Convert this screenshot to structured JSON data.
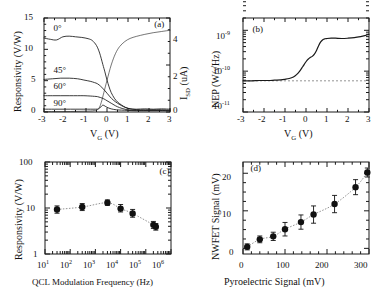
{
  "figure": {
    "width": 391,
    "height": 297,
    "background": "#ffffff",
    "line_color": "#1a1a1a",
    "marker_color": "#111111",
    "dash_color": "#777777"
  },
  "chart_data": [
    {
      "id": "a",
      "panel_label": "(a)",
      "type": "line",
      "title": "",
      "xlabel": "V_G (V)",
      "xlabel_parts": {
        "base": "V",
        "sub": "G",
        "unit": " (V)"
      },
      "ylabel": "Responsivity (V/W)",
      "ylabel_right": "I_SD (uA)",
      "ylabel_right_parts": {
        "base": "I",
        "sub": "SD",
        "unit": " (uA)"
      },
      "xlim": [
        -3,
        3
      ],
      "ylim": [
        0,
        15
      ],
      "ylim_right": [
        0,
        4.6
      ],
      "xticks": [
        -3,
        -2,
        -1,
        0,
        1,
        2,
        3
      ],
      "yticks": [
        0,
        5,
        10,
        15
      ],
      "yticks_right": [
        0,
        2,
        4
      ],
      "grid": false,
      "legend_position": "inline-annotations",
      "annotations": [
        "0°",
        "45°",
        "60°",
        "90°"
      ],
      "series": [
        {
          "name": "0°",
          "axis": "left",
          "x": [
            -3,
            -2.7,
            -2.4,
            -2.1,
            -1.8,
            -1.5,
            -1.2,
            -0.9,
            -0.7,
            -0.5,
            -0.35,
            -0.2,
            -0.1,
            0,
            0.1,
            0.2,
            0.35,
            0.5,
            0.7,
            0.9,
            1.1,
            1.4,
            1.8,
            2.2,
            2.6,
            3
          ],
          "values": [
            11.8,
            11.6,
            11.5,
            12.0,
            12.1,
            12.0,
            11.9,
            11.7,
            11.4,
            10.6,
            9.4,
            7.6,
            6.4,
            5.1,
            4.0,
            3.1,
            2.2,
            1.6,
            1.1,
            0.7,
            0.5,
            0.45,
            0.5,
            0.45,
            0.5,
            0.45
          ]
        },
        {
          "name": "45°",
          "axis": "left",
          "x": [
            -3,
            -2.6,
            -2.2,
            -1.8,
            -1.4,
            -1.1,
            -0.8,
            -0.6,
            -0.45,
            -0.3,
            -0.15,
            0,
            0.15,
            0.3,
            0.5,
            0.7,
            0.9,
            1.2,
            1.6,
            2.1,
            2.6,
            3
          ],
          "values": [
            5.2,
            5.3,
            5.4,
            5.4,
            5.3,
            5.1,
            4.9,
            4.7,
            4.5,
            4.1,
            3.6,
            3.0,
            2.4,
            1.9,
            1.4,
            1.0,
            0.7,
            0.45,
            0.35,
            0.35,
            0.35,
            0.3
          ]
        },
        {
          "name": "60°",
          "axis": "left",
          "x": [
            -3,
            -2.6,
            -2.2,
            -1.8,
            -1.4,
            -1.1,
            -0.8,
            -0.6,
            -0.45,
            -0.3,
            -0.15,
            0,
            0.2,
            0.4,
            0.6,
            0.85,
            1.1,
            1.5,
            2.0,
            2.5,
            3
          ],
          "values": [
            2.6,
            2.6,
            2.6,
            2.6,
            2.6,
            2.6,
            2.55,
            2.5,
            2.45,
            2.3,
            2.1,
            1.8,
            1.4,
            1.0,
            0.7,
            0.45,
            0.3,
            0.25,
            0.25,
            0.25,
            0.2
          ]
        },
        {
          "name": "90°",
          "axis": "left",
          "x": [
            -3,
            -2.5,
            -2.0,
            -1.5,
            -1.1,
            -0.8,
            -0.55,
            -0.4,
            -0.3,
            -0.2,
            -0.1,
            0,
            0.2,
            0.45,
            0.7,
            1.0,
            1.4,
            1.9,
            2.4,
            3
          ],
          "values": [
            0.45,
            0.45,
            0.45,
            0.45,
            0.45,
            0.45,
            0.45,
            0.5,
            0.8,
            1.1,
            0.95,
            0.75,
            0.5,
            0.35,
            0.3,
            0.25,
            0.2,
            0.2,
            0.2,
            0.2
          ]
        },
        {
          "name": "I_SD",
          "axis": "right",
          "x": [
            -3,
            -2.5,
            -2.0,
            -1.5,
            -1.1,
            -0.8,
            -0.6,
            -0.45,
            -0.35,
            -0.25,
            -0.15,
            0,
            0.2,
            0.4,
            0.6,
            0.85,
            1.1,
            1.4,
            1.8,
            2.2,
            2.6,
            3
          ],
          "values": [
            0.02,
            0.02,
            0.02,
            0.03,
            0.04,
            0.05,
            0.07,
            0.12,
            0.25,
            0.55,
            0.95,
            1.55,
            2.3,
            2.85,
            3.2,
            3.45,
            3.6,
            3.7,
            3.8,
            3.88,
            3.94,
            4.0
          ]
        }
      ]
    },
    {
      "id": "b",
      "panel_label": "(b)",
      "type": "line",
      "title": "",
      "xlabel": "V_G (V)",
      "xlabel_parts": {
        "base": "V",
        "sub": "G",
        "unit": " (V)"
      },
      "ylabel": "NEP (W/√Hz)",
      "xlim": [
        -3,
        3
      ],
      "ylim": [
        1e-11,
        2e-09
      ],
      "yscale": "log",
      "xticks": [
        -3,
        -2,
        -1,
        0,
        1,
        2,
        3
      ],
      "yticks": [
        1e-11,
        1e-10,
        1e-09
      ],
      "ytick_labels": [
        "10⁻¹¹",
        "10⁻¹⁰",
        "10⁻⁹"
      ],
      "grid": false,
      "reference_line": {
        "type": "horizontal-dashed",
        "value": 5.8e-11
      },
      "series": [
        {
          "name": "NEP",
          "x": [
            -3,
            -2.6,
            -2.2,
            -1.8,
            -1.5,
            -1.2,
            -1.0,
            -0.8,
            -0.6,
            -0.45,
            -0.3,
            -0.15,
            0,
            0.1,
            0.2,
            0.3,
            0.4,
            0.5,
            0.6,
            0.7,
            0.8,
            0.9,
            1.0,
            1.2,
            1.4,
            1.7,
            2.0,
            2.3,
            2.6,
            2.8,
            3.0
          ],
          "values": [
            5.8e-11,
            5.8e-11,
            5.9e-11,
            5.9e-11,
            6e-11,
            6.1e-11,
            6.3e-11,
            6.6e-11,
            7.2e-11,
            8.2e-11,
            1e-10,
            1.3e-10,
            1.7e-10,
            1.95e-10,
            2.15e-10,
            2.3e-10,
            2.6e-10,
            3.2e-10,
            4.2e-10,
            5.2e-10,
            5.9e-10,
            6.2e-10,
            6.3e-10,
            6.4e-10,
            6.4e-10,
            6.3e-10,
            6.4e-10,
            6.6e-10,
            7e-10,
            7.4e-10,
            8e-10
          ]
        }
      ]
    },
    {
      "id": "c",
      "panel_label": "(c)",
      "type": "scatter",
      "title": "",
      "xlabel": "QCL Modulation Frequency (Hz)",
      "ylabel": "Responsivity (V/W)",
      "xlim": [
        10,
        1000000
      ],
      "ylim": [
        1,
        100
      ],
      "xscale": "log",
      "yscale": "log",
      "xticks": [
        10,
        100,
        1000,
        10000,
        100000,
        1000000
      ],
      "xtick_labels": [
        "10¹",
        "10²",
        "10³",
        "10⁴",
        "10⁵",
        "10⁶"
      ],
      "yticks": [
        1,
        10,
        100
      ],
      "ytick_labels": [
        "1",
        "10",
        "100"
      ],
      "grid": false,
      "connector": "dotted",
      "series": [
        {
          "name": "Responsivity vs modulation frequency",
          "x": [
            30,
            300,
            3000,
            10000,
            30000,
            200000,
            250000
          ],
          "values": [
            9.3,
            10.5,
            13.0,
            9.7,
            7.6,
            4.3,
            3.9
          ],
          "yerr_low": [
            1.6,
            1.7,
            1.6,
            1.5,
            1.3,
            0.7,
            0.6
          ],
          "yerr_high": [
            1.8,
            2.0,
            2.0,
            2.2,
            1.7,
            0.8,
            0.7
          ]
        }
      ]
    },
    {
      "id": "d",
      "panel_label": "(d)",
      "type": "scatter",
      "title": "",
      "xlabel": "Pyroelectric Signal (mV)",
      "ylabel": "NWFET Signal (mV)",
      "xlim": [
        0,
        300
      ],
      "ylim": [
        -1.5,
        23
      ],
      "xticks": [
        0,
        100,
        200,
        300
      ],
      "yticks": [
        0,
        10,
        20
      ],
      "grid": false,
      "connector": "dotted",
      "series": [
        {
          "name": "NWFET vs pyroelectric",
          "x": [
            10,
            40,
            72,
            100,
            138,
            168,
            218,
            268,
            296
          ],
          "values": [
            0.4,
            2.4,
            3.2,
            5.1,
            7.0,
            9.0,
            11.8,
            16.3,
            20.2
          ],
          "yerr_low": [
            0.8,
            0.9,
            1.1,
            1.8,
            1.9,
            2.3,
            2.3,
            2.0,
            1.2
          ],
          "yerr_high": [
            0.8,
            0.9,
            1.1,
            1.8,
            1.9,
            2.3,
            2.3,
            2.0,
            1.2
          ]
        }
      ]
    }
  ]
}
